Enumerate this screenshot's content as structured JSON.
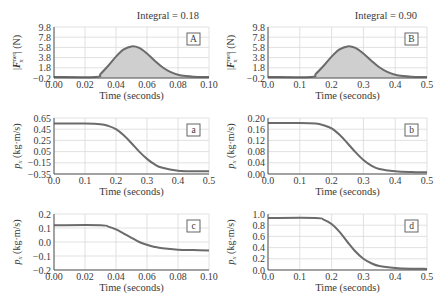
{
  "figure": {
    "line_color": "#6b6b6b",
    "fill_color": "#cfcfcf",
    "grid_color": "#d9d9d9",
    "axis_color": "#555555",
    "text_color": "#3a3a3a"
  },
  "chart_data": [
    {
      "id": "A",
      "type": "area",
      "panel_label": "A",
      "annotation": "Integral = 0.18",
      "xlabel": "Time (seconds)",
      "ylabel": "|F_x^net| (N)",
      "xlim": [
        0.0,
        0.1
      ],
      "ylim": [
        -0.2,
        9.8
      ],
      "xticks": [
        "0.00",
        "0.02",
        "0.04",
        "0.06",
        "0.08",
        "0.10"
      ],
      "yticks": [
        "9.8",
        "7.8",
        "5.8",
        "3.8",
        "1.8",
        "-0.2"
      ],
      "grid": true,
      "x": [
        0.0,
        0.027,
        0.03,
        0.035,
        0.04,
        0.045,
        0.05,
        0.055,
        0.06,
        0.065,
        0.07,
        0.075,
        0.08,
        0.085,
        0.09,
        0.1
      ],
      "y": [
        0.0,
        0.0,
        0.6,
        2.2,
        4.0,
        5.4,
        6.0,
        5.7,
        4.6,
        3.2,
        1.9,
        1.0,
        0.45,
        0.18,
        0.06,
        0.0
      ]
    },
    {
      "id": "B",
      "type": "area",
      "panel_label": "B",
      "annotation": "Integral = 0.90",
      "xlabel": "Time (seconds)",
      "ylabel": "|F_x^net| (N)",
      "xlim": [
        0.0,
        0.5
      ],
      "ylim": [
        -0.2,
        9.8
      ],
      "xticks": [
        "0.0",
        "0.1",
        "0.2",
        "0.3",
        "0.4",
        "0.5"
      ],
      "yticks": [
        "9.8",
        "7.8",
        "5.8",
        "3.8",
        "1.8",
        "-0.2"
      ],
      "grid": true,
      "x": [
        0.0,
        0.135,
        0.15,
        0.175,
        0.2,
        0.225,
        0.25,
        0.275,
        0.3,
        0.325,
        0.35,
        0.375,
        0.4,
        0.425,
        0.45,
        0.5
      ],
      "y": [
        0.0,
        0.0,
        0.6,
        2.2,
        4.0,
        5.4,
        6.0,
        5.7,
        4.6,
        3.2,
        1.9,
        1.0,
        0.45,
        0.18,
        0.06,
        0.0
      ]
    },
    {
      "id": "a",
      "type": "line",
      "panel_label": "a",
      "xlabel": "Time (seconds)",
      "ylabel": "p_x (kg·m/s)",
      "xlim": [
        0.0,
        0.5
      ],
      "ylim": [
        -0.35,
        0.65
      ],
      "xticks": [
        "0.0",
        "0.1",
        "0.2",
        "0.3",
        "0.4",
        "0.5"
      ],
      "yticks": [
        "0.65",
        "0.45",
        "0.25",
        "0.05",
        "-0.15",
        "-0.35"
      ],
      "grid": true,
      "x": [
        0.0,
        0.1,
        0.15,
        0.175,
        0.2,
        0.225,
        0.25,
        0.275,
        0.3,
        0.325,
        0.35,
        0.4,
        0.45,
        0.5
      ],
      "y": [
        0.55,
        0.55,
        0.54,
        0.51,
        0.45,
        0.34,
        0.2,
        0.05,
        -0.08,
        -0.18,
        -0.24,
        -0.29,
        -0.3,
        -0.3
      ]
    },
    {
      "id": "b",
      "type": "line",
      "panel_label": "b",
      "xlabel": "Time (seconds)",
      "ylabel": "p_x (kg·m/s)",
      "xlim": [
        0.0,
        0.5
      ],
      "ylim": [
        0.0,
        0.2
      ],
      "xticks": [
        "0.0",
        "0.1",
        "0.2",
        "0.3",
        "0.4",
        "0.5"
      ],
      "yticks": [
        "0.20",
        "0.16",
        "0.12",
        "0.08",
        "0.04",
        "0.00"
      ],
      "grid": true,
      "x": [
        0.0,
        0.1,
        0.15,
        0.175,
        0.2,
        0.225,
        0.25,
        0.275,
        0.3,
        0.325,
        0.35,
        0.4,
        0.45,
        0.5
      ],
      "y": [
        0.182,
        0.182,
        0.18,
        0.174,
        0.163,
        0.14,
        0.11,
        0.078,
        0.05,
        0.03,
        0.018,
        0.01,
        0.007,
        0.006
      ]
    },
    {
      "id": "c",
      "type": "line",
      "panel_label": "c",
      "xlabel": "Time (seconds)",
      "ylabel": "p_x (kg·m/s)",
      "xlim": [
        0.0,
        0.1
      ],
      "ylim": [
        -0.2,
        0.2
      ],
      "xticks": [
        "0.00",
        "0.02",
        "0.04",
        "0.06",
        "0.08",
        "0.10"
      ],
      "yticks": [
        "0.2",
        "0.1",
        "0.0",
        "-0.1",
        "-0.2"
      ],
      "grid": true,
      "x": [
        0.0,
        0.03,
        0.035,
        0.04,
        0.045,
        0.05,
        0.055,
        0.06,
        0.065,
        0.07,
        0.08,
        0.09,
        0.1
      ],
      "y": [
        0.12,
        0.12,
        0.11,
        0.09,
        0.06,
        0.03,
        0.0,
        -0.02,
        -0.035,
        -0.045,
        -0.055,
        -0.058,
        -0.06
      ]
    },
    {
      "id": "d",
      "type": "line",
      "panel_label": "d",
      "xlabel": "Time (seconds)",
      "ylabel": "p_x (kg·m/s)",
      "xlim": [
        0.0,
        0.5
      ],
      "ylim": [
        0.0,
        1.0
      ],
      "xticks": [
        "0.0",
        "0.1",
        "0.2",
        "0.3",
        "0.4",
        "0.5"
      ],
      "yticks": [
        "1.0",
        "0.8",
        "0.6",
        "0.4",
        "0.2",
        "0.0"
      ],
      "grid": true,
      "x": [
        0.0,
        0.15,
        0.175,
        0.2,
        0.225,
        0.25,
        0.275,
        0.3,
        0.325,
        0.35,
        0.4,
        0.45,
        0.5
      ],
      "y": [
        0.93,
        0.93,
        0.9,
        0.82,
        0.68,
        0.5,
        0.33,
        0.2,
        0.12,
        0.07,
        0.035,
        0.022,
        0.02
      ]
    }
  ]
}
